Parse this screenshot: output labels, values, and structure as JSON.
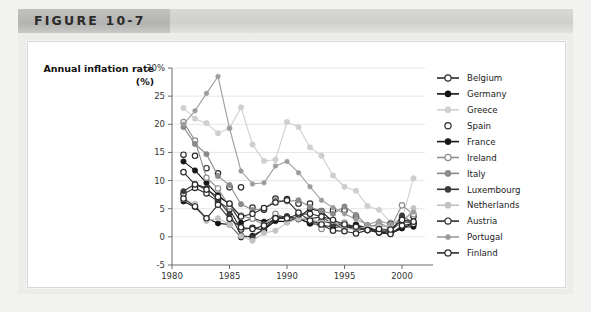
{
  "figure": {
    "label": "FIGURE 10-7",
    "bottom_note": ""
  },
  "chart_data": {
    "type": "line",
    "title": "",
    "ylabel": "Annual inflation rate (%)",
    "ylabel_line1": "Annual inflation rate",
    "ylabel_line2": "(%)",
    "xlabel": "",
    "xlim": [
      1980,
      2002
    ],
    "ylim": [
      -5,
      30
    ],
    "yticks": [
      -5,
      0,
      5,
      10,
      15,
      20,
      25,
      30
    ],
    "ytick_labels": [
      "-5",
      "0",
      "5",
      "10",
      "15",
      "20",
      "25",
      "30%"
    ],
    "xticks": [
      1980,
      1985,
      1990,
      1995,
      2000
    ],
    "xtick_labels": [
      "1980",
      "1985",
      "1990",
      "1995",
      "2000"
    ],
    "grid": "horizontal",
    "legend_position": "right",
    "x": [
      1981,
      1982,
      1983,
      1984,
      1985,
      1986,
      1987,
      1988,
      1989,
      1990,
      1991,
      1992,
      1993,
      1994,
      1995,
      1996,
      1997,
      1998,
      1999,
      2000,
      2001
    ],
    "series": [
      {
        "name": "Belgium",
        "color": "#2b2b2b",
        "marker": "open-circle",
        "values": [
          7.6,
          8.7,
          7.7,
          6.3,
          4.9,
          1.3,
          1.6,
          1.2,
          3.1,
          3.5,
          3.2,
          2.4,
          2.8,
          2.4,
          1.5,
          2.1,
          1.6,
          1.0,
          1.1,
          2.7,
          2.4
        ]
      },
      {
        "name": "Germany",
        "color": "#121212",
        "marker": "filled-circle",
        "values": [
          6.3,
          5.3,
          3.3,
          2.4,
          2.2,
          -0.1,
          0.2,
          1.3,
          2.8,
          2.7,
          3.5,
          5.0,
          4.5,
          2.7,
          1.8,
          1.5,
          1.8,
          0.9,
          0.6,
          1.5,
          2.4
        ]
      },
      {
        "name": "Greece",
        "color": "#cfcfcf",
        "marker": "filled-circle",
        "values": [
          22.9,
          21.0,
          20.2,
          18.4,
          19.3,
          23.0,
          16.4,
          13.5,
          13.7,
          20.4,
          19.5,
          15.9,
          14.4,
          10.9,
          8.9,
          8.2,
          5.5,
          4.8,
          2.6,
          3.2,
          10.4
        ]
      },
      {
        "name": "Spain",
        "color": "#2b2b2b",
        "marker": "open-circle-nostem",
        "values": [
          14.6,
          14.4,
          12.2,
          11.3,
          8.8,
          8.8,
          5.2,
          4.8,
          6.8,
          6.7,
          5.9,
          5.9,
          4.6,
          4.7,
          4.7,
          3.6,
          2.0,
          1.8,
          2.3,
          3.4,
          3.6
        ]
      },
      {
        "name": "France",
        "color": "#171717",
        "marker": "filled-circle",
        "values": [
          13.4,
          11.8,
          9.6,
          7.4,
          5.8,
          2.5,
          3.3,
          2.7,
          3.6,
          3.4,
          3.2,
          2.4,
          2.1,
          1.7,
          1.8,
          2.1,
          1.3,
          0.7,
          0.5,
          1.7,
          1.8
        ]
      },
      {
        "name": "Ireland",
        "color": "#8f8f8f",
        "marker": "open-circle",
        "values": [
          20.4,
          17.1,
          10.5,
          8.6,
          5.4,
          3.8,
          3.2,
          2.1,
          4.1,
          3.3,
          3.2,
          3.1,
          1.4,
          2.3,
          2.5,
          1.7,
          1.5,
          2.4,
          1.6,
          5.6,
          4.0
        ]
      },
      {
        "name": "Italy",
        "color": "#8a8a8a",
        "marker": "filled-circle",
        "values": [
          19.5,
          16.5,
          14.7,
          10.8,
          9.2,
          5.8,
          4.8,
          5.0,
          6.5,
          6.3,
          6.5,
          5.3,
          4.6,
          4.1,
          5.4,
          3.9,
          2.0,
          2.0,
          1.7,
          2.6,
          2.7
        ]
      },
      {
        "name": "Luxembourg",
        "color": "#3a3a3a",
        "marker": "filled-circle",
        "values": [
          8.1,
          9.4,
          8.7,
          6.5,
          4.1,
          0.3,
          -0.1,
          1.4,
          3.4,
          3.7,
          3.1,
          3.2,
          3.6,
          2.2,
          1.9,
          1.2,
          1.4,
          1.0,
          1.0,
          3.8,
          2.4
        ]
      },
      {
        "name": "Netherlands",
        "color": "#c2c2c2",
        "marker": "filled-circle",
        "values": [
          6.7,
          5.9,
          2.8,
          3.3,
          2.2,
          0.1,
          -0.7,
          0.7,
          1.1,
          2.5,
          3.2,
          3.2,
          2.6,
          2.8,
          1.4,
          1.4,
          1.9,
          1.8,
          2.0,
          2.3,
          5.1
        ]
      },
      {
        "name": "Austria",
        "color": "#2b2b2b",
        "marker": "open-circle",
        "values": [
          6.8,
          5.4,
          3.3,
          5.7,
          3.2,
          1.7,
          1.4,
          2.0,
          3.3,
          3.3,
          4.0,
          4.1,
          3.6,
          3.0,
          2.2,
          1.8,
          1.2,
          0.8,
          0.5,
          2.0,
          2.3
        ]
      },
      {
        "name": "Portugal",
        "color": "#9c9c9c",
        "marker": "filled-circle-small",
        "values": [
          20.0,
          22.4,
          25.5,
          28.5,
          19.3,
          11.7,
          9.4,
          9.6,
          12.6,
          13.4,
          11.4,
          8.9,
          6.5,
          5.2,
          4.1,
          3.1,
          2.2,
          2.8,
          2.3,
          2.9,
          4.4
        ]
      },
      {
        "name": "Finland",
        "color": "#2b2b2b",
        "marker": "open-circle",
        "values": [
          11.5,
          9.3,
          8.4,
          7.1,
          5.9,
          3.6,
          4.1,
          5.1,
          6.1,
          6.5,
          4.3,
          2.9,
          2.2,
          1.1,
          1.0,
          0.6,
          1.2,
          1.4,
          1.3,
          3.0,
          2.7
        ]
      }
    ]
  }
}
